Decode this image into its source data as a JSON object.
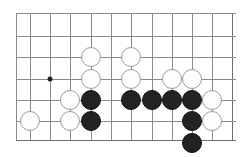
{
  "figure": {
    "type": "go-board-diagram",
    "background_color": "#ffffff",
    "black_stone_color": "#232323",
    "white_stone_color": "#fdfdfd",
    "line_color": "#8a8a8a",
    "edge_line_color": "#6e6e6e",
    "stone_diameter": 20
  },
  "board": {
    "cell_size": 20.3,
    "origin_x": 16,
    "origin_y": 13,
    "columns_x": [
      16,
      29.5,
      50,
      70,
      90.5,
      111,
      131,
      151.5,
      172,
      192,
      212,
      232
    ],
    "rows_y": [
      13,
      36,
      57,
      79,
      100,
      121,
      140
    ],
    "vertical_lines": [
      {
        "x": 16,
        "y1": 13,
        "y2": 140,
        "edge": false
      },
      {
        "x": 29.5,
        "y1": 13,
        "y2": 140,
        "edge": false
      },
      {
        "x": 50,
        "y1": 13,
        "y2": 140,
        "edge": false
      },
      {
        "x": 70,
        "y1": 13,
        "y2": 140,
        "edge": false
      },
      {
        "x": 90.5,
        "y1": 13,
        "y2": 140,
        "edge": false
      },
      {
        "x": 111,
        "y1": 13,
        "y2": 140,
        "edge": false
      },
      {
        "x": 131,
        "y1": 13,
        "y2": 140,
        "edge": false
      },
      {
        "x": 151.5,
        "y1": 13,
        "y2": 140,
        "edge": false
      },
      {
        "x": 172,
        "y1": 13,
        "y2": 140,
        "edge": false
      },
      {
        "x": 192,
        "y1": 13,
        "y2": 140,
        "edge": false
      },
      {
        "x": 212,
        "y1": 13,
        "y2": 140,
        "edge": false
      },
      {
        "x": 232,
        "y1": 13,
        "y2": 140,
        "edge": true
      }
    ],
    "horizontal_lines": [
      {
        "y": 13,
        "x1": 16,
        "x2": 236,
        "edge": false
      },
      {
        "y": 36,
        "x1": 16,
        "x2": 236,
        "edge": false
      },
      {
        "y": 57,
        "x1": 16,
        "x2": 236,
        "edge": false
      },
      {
        "y": 79,
        "x1": 16,
        "x2": 236,
        "edge": false
      },
      {
        "y": 100,
        "x1": 16,
        "x2": 236,
        "edge": false
      },
      {
        "y": 121,
        "x1": 16,
        "x2": 236,
        "edge": false
      },
      {
        "y": 140,
        "x1": 16,
        "x2": 236,
        "edge": true
      }
    ],
    "star_points": [
      {
        "x": 50,
        "y": 79
      }
    ]
  },
  "stones": [
    {
      "color": "white",
      "x": 90.5,
      "y": 57
    },
    {
      "color": "white",
      "x": 131,
      "y": 57
    },
    {
      "color": "white",
      "x": 90.5,
      "y": 79
    },
    {
      "color": "white",
      "x": 131,
      "y": 79
    },
    {
      "color": "white",
      "x": 172,
      "y": 79
    },
    {
      "color": "white",
      "x": 192,
      "y": 79
    },
    {
      "color": "white",
      "x": 70,
      "y": 100
    },
    {
      "color": "black",
      "x": 90.5,
      "y": 100
    },
    {
      "color": "black",
      "x": 131,
      "y": 100
    },
    {
      "color": "black",
      "x": 151.5,
      "y": 100
    },
    {
      "color": "black",
      "x": 172,
      "y": 100
    },
    {
      "color": "black",
      "x": 192,
      "y": 100
    },
    {
      "color": "white",
      "x": 212,
      "y": 100
    },
    {
      "color": "white",
      "x": 29.5,
      "y": 121
    },
    {
      "color": "white",
      "x": 70,
      "y": 121
    },
    {
      "color": "black",
      "x": 90.5,
      "y": 121
    },
    {
      "color": "black",
      "x": 192,
      "y": 121
    },
    {
      "color": "white",
      "x": 212,
      "y": 121
    },
    {
      "color": "black",
      "x": 192,
      "y": 143
    }
  ]
}
